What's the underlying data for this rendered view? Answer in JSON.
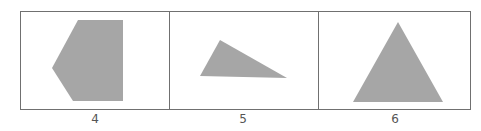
{
  "colors": {
    "shape_fill": "#a6a6a6",
    "border": "#707070",
    "label": "#555555"
  },
  "panels": [
    {
      "label": "4",
      "shape": "pentagon"
    },
    {
      "label": "5",
      "shape": "scalene-triangle"
    },
    {
      "label": "6",
      "shape": "isosceles-triangle"
    }
  ]
}
